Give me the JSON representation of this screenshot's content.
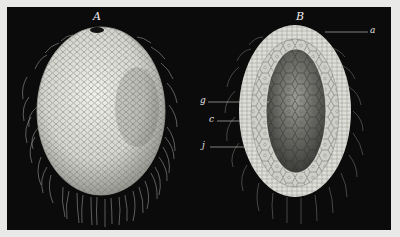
{
  "figure": {
    "panel_labels": [
      {
        "id": "A",
        "label": "A",
        "description": "external view of ciliated ovoid larva with apical pore"
      },
      {
        "id": "B",
        "label": "B",
        "description": "longitudinal section showing cell layers"
      }
    ],
    "part_labels": [
      {
        "id": "a",
        "label": "a"
      },
      {
        "id": "g",
        "label": "g"
      },
      {
        "id": "c",
        "label": "c"
      },
      {
        "id": "j",
        "label": "j"
      }
    ],
    "colors": {
      "background_page": "#e9e9e7",
      "plate_background": "#0b0b0b",
      "specimen_light": "#e6e6e2",
      "specimen_mid": "#b8b8b2",
      "cilia": "#d8d8d2"
    }
  }
}
